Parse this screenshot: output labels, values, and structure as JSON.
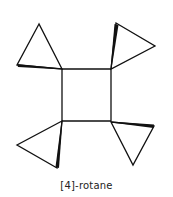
{
  "diagram": {
    "caption": "[4]-rotane",
    "stroke_color": "#111111",
    "square": {
      "points": [
        [
          62,
          69
        ],
        [
          111,
          69
        ],
        [
          111,
          121
        ],
        [
          62,
          121
        ]
      ]
    },
    "cyclopropanes": [
      {
        "name": "top-left",
        "points": [
          [
            39,
            24
          ],
          [
            17,
            65
          ],
          [
            62,
            69
          ]
        ],
        "bold_edge": [
          [
            17,
            65
          ],
          [
            62,
            69
          ]
        ]
      },
      {
        "name": "top-right",
        "points": [
          [
            116,
            23
          ],
          [
            155,
            46
          ],
          [
            111,
            69
          ]
        ],
        "bold_edge": [
          [
            116,
            23
          ],
          [
            111,
            69
          ]
        ]
      },
      {
        "name": "bottom-left",
        "points": [
          [
            62,
            121
          ],
          [
            17,
            145
          ],
          [
            57,
            168
          ]
        ],
        "bold_edge": [
          [
            62,
            121
          ],
          [
            57,
            168
          ]
        ]
      },
      {
        "name": "bottom-right",
        "points": [
          [
            111,
            122
          ],
          [
            154,
            126
          ],
          [
            133,
            165
          ]
        ],
        "bold_edge": [
          [
            111,
            122
          ],
          [
            154,
            126
          ]
        ]
      }
    ]
  }
}
